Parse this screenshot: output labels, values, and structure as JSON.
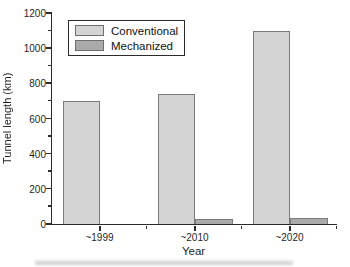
{
  "figure": {
    "background": "#ffffff",
    "text_color": "#1f1f1f",
    "axis_color": "#2b2b2b"
  },
  "chart_data": {
    "type": "bar",
    "title": "",
    "xlabel": "Year",
    "ylabel": "Tunnel length (km)",
    "categories": [
      "~1999",
      "~2010",
      "~2020"
    ],
    "series": [
      {
        "name": "Conventional",
        "values": [
          700,
          740,
          1100
        ],
        "fill": "#d4d4d4",
        "border": "#7a7a7a"
      },
      {
        "name": "Mechanized",
        "values": [
          0,
          30,
          35
        ],
        "fill": "#aaaaaa",
        "border": "#7a7a7a"
      }
    ],
    "ylim": [
      0,
      1200
    ],
    "y_major_step": 200,
    "y_minor_step": 100,
    "y_tick_labels": [
      "0",
      "200",
      "400",
      "600",
      "800",
      "1000",
      "1200"
    ],
    "grid": false,
    "legend": {
      "position": "top-left-inside",
      "entries": [
        "Conventional",
        "Mechanized"
      ]
    }
  }
}
